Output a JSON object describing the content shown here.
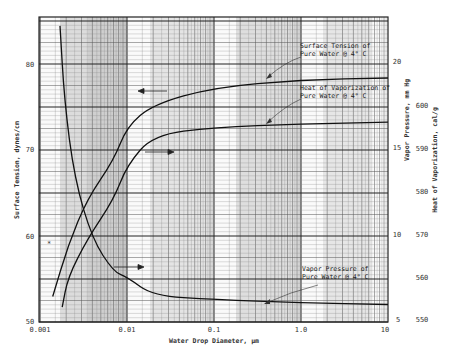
{
  "chart_data": {
    "type": "line",
    "title": "",
    "xlabel": "Water Drop Diameter, µm",
    "xscale": "log",
    "xlim": [
      0.001,
      10
    ],
    "xticks": [
      "0.001",
      "0.01",
      "0.1",
      "1.0",
      "10"
    ],
    "y_axes": [
      {
        "id": "left",
        "label": "Surface Tension, dynes/cm",
        "ylim": [
          50,
          84
        ],
        "ticks": [
          "50",
          "60",
          "70",
          "80"
        ]
      },
      {
        "id": "right1",
        "label": "Vapor Pressure, mm Hg",
        "ylim": [
          5,
          21
        ],
        "ticks": [
          "5",
          "10",
          "15",
          "20"
        ]
      },
      {
        "id": "right2",
        "label": "Heat of Vaporization, cal/g",
        "ylim": [
          550,
          605
        ],
        "ticks": [
          "550",
          "560",
          "570",
          "580",
          "590",
          "600"
        ]
      }
    ],
    "grid": true,
    "series": [
      {
        "name": "Surface Tension",
        "axis": "left",
        "x": [
          0.0014,
          0.0021,
          0.0035,
          0.007,
          0.01,
          0.02,
          0.1,
          1.0,
          10
        ],
        "values": [
          53,
          59,
          64.5,
          69,
          73,
          75.6,
          77.6,
          78.5,
          78.7
        ]
      },
      {
        "name": "Heat of Vaporization",
        "axis": "right2",
        "x": [
          0.0018,
          0.0021,
          0.0035,
          0.007,
          0.01,
          0.02,
          0.1,
          1.0,
          10
        ],
        "values": [
          553,
          560,
          568.8,
          578,
          586,
          593,
          594.8,
          595.6,
          596
        ]
      },
      {
        "name": "Vapor Pressure",
        "axis": "right1",
        "x": [
          0.0017,
          0.0019,
          0.0025,
          0.004,
          0.007,
          0.01,
          0.02,
          0.1,
          1.0,
          10
        ],
        "values": [
          22.1,
          17.8,
          13.2,
          9.7,
          7.8,
          7.5,
          6.4,
          6.2,
          6.0,
          5.9
        ]
      }
    ],
    "annotations": [
      {
        "text": "Surface Tension of Pure Water @ 4° C",
        "points_to": "Surface Tension asymptote"
      },
      {
        "text": "Heat of Vaporization of Pure Water @ 4° C",
        "points_to": "Heat of Vaporization asymptote"
      },
      {
        "text": "Vapor Pressure of Pure Water @ 4° C",
        "points_to": "Vapor Pressure asymptote"
      }
    ],
    "axis_arrows": [
      {
        "direction": "left",
        "curve": "Surface Tension"
      },
      {
        "direction": "right",
        "curve": "Heat of Vaporization"
      },
      {
        "direction": "right",
        "curve": "Vapor Pressure"
      }
    ]
  },
  "labels": {
    "xlabel": "Water Drop Diameter, µm",
    "ylabel_left": "Surface Tension, dynes/cm",
    "ylabel_right1": "Vapor Pressure, mm Hg",
    "ylabel_right2": "Heat of Vaporization, cal/g",
    "ann_st_1": "Surface Tension of",
    "ann_st_2": "Pure Water @ 4° C",
    "ann_hv_1": "Heat of Vaporization of",
    "ann_hv_2": "Pure Water @ 4° C",
    "ann_vp_1": "Vapor Pressure of",
    "ann_vp_2": "Pure Water @ 4° C",
    "x_ticks": [
      "0.001",
      "0.01",
      "0.1",
      "1.0",
      "10"
    ],
    "left_ticks": [
      "50",
      "60",
      "70",
      "80"
    ],
    "vp_ticks": [
      "5",
      "10",
      "15",
      "20"
    ],
    "hv_ticks": [
      "550",
      "560",
      "570",
      "580",
      "590",
      "600"
    ]
  }
}
